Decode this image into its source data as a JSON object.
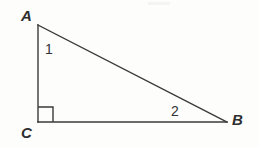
{
  "figure": {
    "type": "right-triangle-diagram",
    "background_color": "#fdfdfc",
    "stroke_color": "#3a3a3a",
    "text_color": "#2e2e2e",
    "width": 259,
    "height": 148,
    "vertices": {
      "A": {
        "label": "A",
        "x": 38,
        "y": 25
      },
      "B": {
        "label": "B",
        "x": 227,
        "y": 122
      },
      "C": {
        "label": "C",
        "x": 38,
        "y": 122
      }
    },
    "angle_marks": {
      "angle_1": {
        "label": "1",
        "at_vertex": "A"
      },
      "angle_2": {
        "label": "2",
        "at_vertex": "B"
      },
      "right_angle": {
        "at_vertex": "C",
        "marker": "square",
        "size": 14
      }
    },
    "sides": [
      {
        "name": "leg-AC",
        "from": "A",
        "to": "C"
      },
      {
        "name": "leg-CB",
        "from": "C",
        "to": "B"
      },
      {
        "name": "hypotenuse-AB",
        "from": "A",
        "to": "B"
      }
    ]
  }
}
